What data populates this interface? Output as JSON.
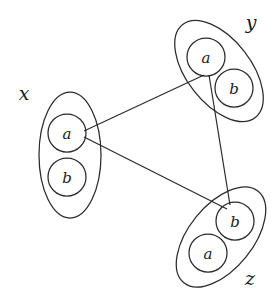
{
  "diagram": {
    "title": "",
    "type": "graph-of-groups",
    "stroke_color": "#2b2b2b",
    "background_color": "#ffffff",
    "groups": [
      {
        "id": "x",
        "label": "x",
        "label_x": 24,
        "label_y": 93,
        "ellipse": {
          "cx": 70,
          "cy": 155,
          "rx": 31,
          "ry": 63,
          "rotate": 0
        },
        "nodes": [
          {
            "id": "x-a",
            "label": "a",
            "cx": 67,
            "cy": 133,
            "r": 19
          },
          {
            "id": "x-b",
            "label": "b",
            "cx": 67,
            "cy": 177,
            "r": 19
          }
        ]
      },
      {
        "id": "y",
        "label": "y",
        "label_x": 251,
        "label_y": 22,
        "ellipse": {
          "cx": 219,
          "cy": 71,
          "rx": 59,
          "ry": 32,
          "rotate": 52
        },
        "nodes": [
          {
            "id": "y-a",
            "label": "a",
            "cx": 206,
            "cy": 57,
            "r": 19
          },
          {
            "id": "y-b",
            "label": "b",
            "cx": 234,
            "cy": 88,
            "r": 19
          }
        ]
      },
      {
        "id": "z",
        "label": "z",
        "label_x": 250,
        "label_y": 278,
        "ellipse": {
          "cx": 221,
          "cy": 237,
          "rx": 59,
          "ry": 32,
          "rotate": -51
        },
        "nodes": [
          {
            "id": "z-b",
            "label": "b",
            "cx": 235,
            "cy": 221,
            "r": 19
          },
          {
            "id": "z-a",
            "label": "a",
            "cx": 208,
            "cy": 253,
            "r": 19
          }
        ]
      }
    ],
    "edges": [
      {
        "id": "edge-xa-ya",
        "from": "x-a",
        "to": "y-a",
        "x1": 84,
        "y1": 131,
        "x2": 204,
        "y2": 75
      },
      {
        "id": "edge-xa-zb",
        "from": "x-a",
        "to": "z-b",
        "x1": 84,
        "y1": 137,
        "x2": 227,
        "y2": 209
      },
      {
        "id": "edge-ya-zb",
        "from": "y-a",
        "to": "z-b",
        "x1": 209,
        "y1": 75,
        "x2": 230,
        "y2": 205
      }
    ]
  }
}
